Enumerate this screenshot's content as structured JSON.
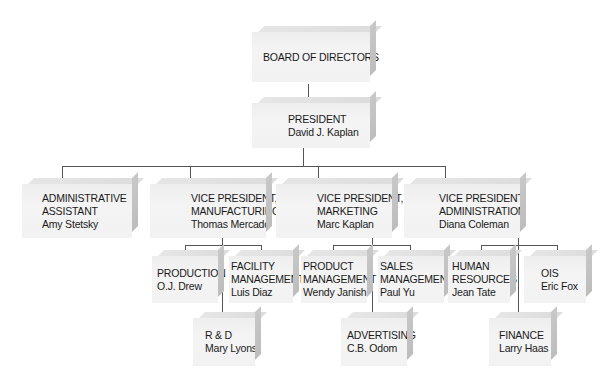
{
  "chart_title": "Organization chart",
  "nodes": {
    "board": {
      "title": [
        "BOARD OF DIRECTORS"
      ],
      "name": ""
    },
    "president": {
      "title": [
        "PRESIDENT"
      ],
      "name": "David J. Kaplan"
    },
    "admin_assistant": {
      "title": [
        "ADMINISTRATIVE",
        "ASSISTANT"
      ],
      "name": "Amy Stetsky"
    },
    "vp_manufacturing": {
      "title": [
        "VICE PRESIDENT,",
        "MANUFACTURING"
      ],
      "name": "Thomas Mercado"
    },
    "vp_marketing": {
      "title": [
        "VICE PRESIDENT,",
        "MARKETING"
      ],
      "name": "Marc Kaplan"
    },
    "vp_administration": {
      "title": [
        "VICE PRESIDENT,",
        "ADMINISTRATION"
      ],
      "name": "Diana Coleman"
    },
    "production": {
      "title": [
        "PRODUCTION"
      ],
      "name": "O.J. Drew"
    },
    "facility_management": {
      "title": [
        "FACILITY",
        "MANAGEMENT"
      ],
      "name": "Luis Diaz"
    },
    "rnd": {
      "title": [
        "R & D"
      ],
      "name": "Mary Lyons"
    },
    "product_management": {
      "title": [
        "PRODUCT",
        "MANAGEMENT"
      ],
      "name": "Wendy Janish"
    },
    "sales_management": {
      "title": [
        "SALES",
        "MANAGEMENT"
      ],
      "name": "Paul Yu"
    },
    "advertising": {
      "title": [
        "ADVERTISING"
      ],
      "name": "C.B. Odom"
    },
    "human_resources": {
      "title": [
        "HUMAN",
        "RESOURCES"
      ],
      "name": "Jean Tate"
    },
    "ois": {
      "title": [
        "OIS"
      ],
      "name": "Eric Fox"
    },
    "finance": {
      "title": [
        "FINANCE"
      ],
      "name": "Larry Haas"
    }
  },
  "hierarchy": {
    "board": [
      "president"
    ],
    "president": [
      "admin_assistant",
      "vp_manufacturing",
      "vp_marketing",
      "vp_administration"
    ],
    "vp_manufacturing": [
      "production",
      "facility_management",
      "rnd"
    ],
    "vp_marketing": [
      "product_management",
      "sales_management",
      "advertising"
    ],
    "vp_administration": [
      "human_resources",
      "ois",
      "finance"
    ]
  },
  "colors": {
    "box": "#f2f2f2",
    "box_top": "#dedede",
    "box_side": "#c2c2c2",
    "line": "#555555",
    "text": "#1a1a1a"
  }
}
